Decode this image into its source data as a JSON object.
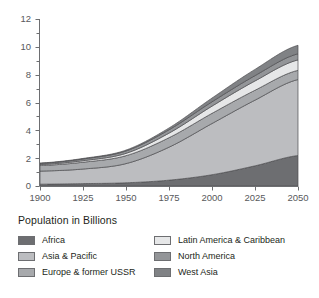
{
  "chart_data": {
    "type": "area",
    "stacked": true,
    "title": "",
    "xlabel": "",
    "ylabel": "",
    "legend_title": "Population in Billions",
    "legend_position": "bottom",
    "grid": false,
    "xlim": [
      1900,
      2050
    ],
    "ylim": [
      0,
      12
    ],
    "x_ticks": [
      "1900",
      "1925",
      "1950",
      "1975",
      "2000",
      "2025",
      "2050"
    ],
    "x_tick_values": [
      1900,
      1925,
      1950,
      1975,
      2000,
      2025,
      2050
    ],
    "y_ticks": [
      "0",
      "2",
      "4",
      "6",
      "8",
      "10",
      "12"
    ],
    "y_tick_values": [
      0,
      2,
      4,
      6,
      8,
      10,
      12
    ],
    "y_minor_step": 1,
    "x": [
      1900,
      1925,
      1950,
      1975,
      2000,
      2025,
      2050
    ],
    "series": [
      {
        "name": "Africa",
        "color": "#6d6e71",
        "values": [
          0.13,
          0.17,
          0.23,
          0.42,
          0.81,
          1.45,
          2.19
        ]
      },
      {
        "name": "Asia & Pacific",
        "color": "#bcbdc0",
        "values": [
          0.94,
          1.05,
          1.38,
          2.37,
          3.68,
          4.72,
          5.46
        ]
      },
      {
        "name": "Europe & former USSR",
        "color": "#a7a9ac",
        "values": [
          0.4,
          0.49,
          0.57,
          0.68,
          0.73,
          0.71,
          0.66
        ]
      },
      {
        "name": "Latin America & Caribbean",
        "color": "#e6e7e8",
        "values": [
          0.07,
          0.11,
          0.17,
          0.33,
          0.52,
          0.67,
          0.75
        ]
      },
      {
        "name": "North America",
        "color": "#939598",
        "values": [
          0.08,
          0.12,
          0.17,
          0.24,
          0.31,
          0.38,
          0.44
        ]
      },
      {
        "name": "West Asia",
        "color": "#808285",
        "values": [
          0.03,
          0.04,
          0.06,
          0.13,
          0.27,
          0.45,
          0.61
        ]
      }
    ],
    "totals": [
      1.65,
      1.98,
      2.58,
      4.17,
      6.32,
      8.38,
      10.11
    ]
  },
  "legend": {
    "title": "Population in Billions",
    "items": [
      {
        "label": "Africa",
        "color": "#6d6e71"
      },
      {
        "label": "Latin America & Caribbean",
        "color": "#e6e7e8"
      },
      {
        "label": "Asia & Pacific",
        "color": "#bcbdc0"
      },
      {
        "label": "North America",
        "color": "#939598"
      },
      {
        "label": "Europe & former USSR",
        "color": "#a7a9ac"
      },
      {
        "label": "West Asia",
        "color": "#808285"
      }
    ]
  },
  "axes": {
    "x_labels": [
      "1900",
      "1925",
      "1950",
      "1975",
      "2000",
      "2025",
      "2050"
    ],
    "y_labels": [
      "0",
      "2",
      "4",
      "6",
      "8",
      "10",
      "12"
    ]
  }
}
